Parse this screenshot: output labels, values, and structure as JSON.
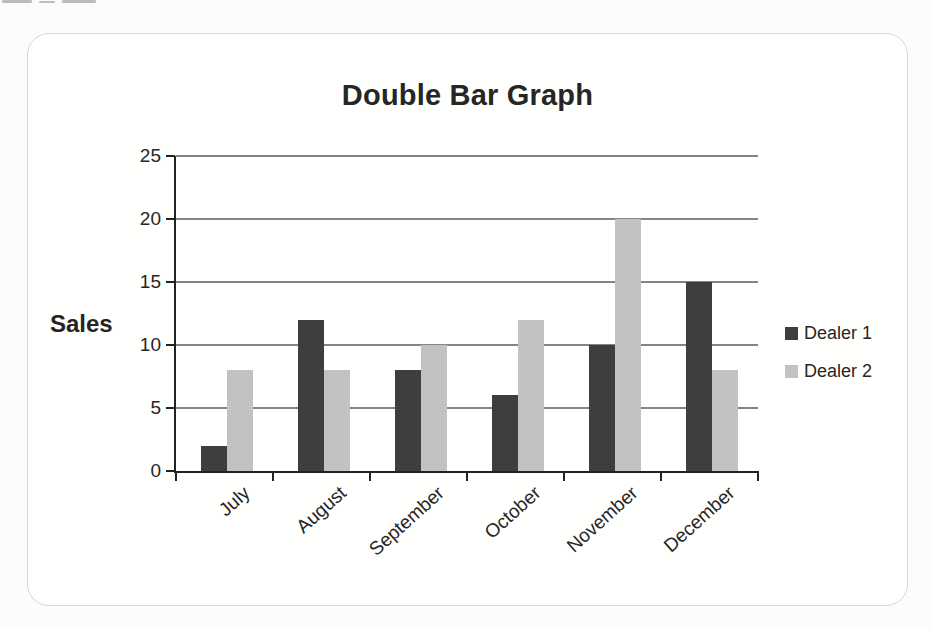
{
  "chart_data": {
    "type": "bar",
    "title": "Double Bar Graph",
    "ylabel": "Sales",
    "xlabel": "",
    "categories": [
      "July",
      "August",
      "September",
      "October",
      "November",
      "December"
    ],
    "series": [
      {
        "name": "Dealer 1",
        "color": "#3e3e3e",
        "values": [
          2,
          12,
          8,
          6,
          10,
          15
        ]
      },
      {
        "name": "Dealer 2",
        "color": "#c2c2c2",
        "values": [
          8,
          8,
          10,
          12,
          20,
          8
        ]
      }
    ],
    "ylim": [
      0,
      25
    ],
    "yticks": [
      0,
      5,
      10,
      15,
      20,
      25
    ],
    "grid": true,
    "legend_position": "right"
  }
}
